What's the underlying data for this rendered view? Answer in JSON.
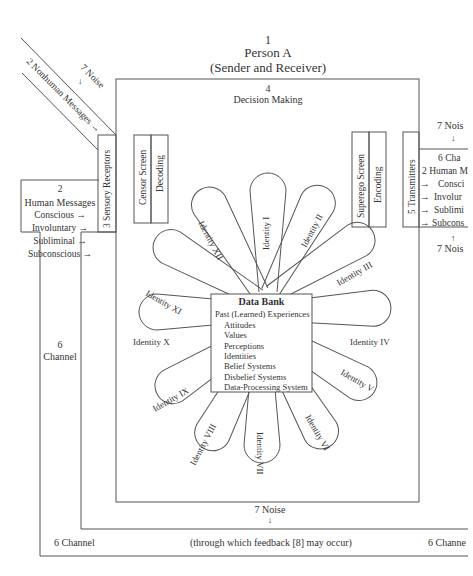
{
  "title": {
    "number": "1",
    "line1": "Person A",
    "line2": "(Sender and Receiver)"
  },
  "decision_making": {
    "number": "4",
    "label": "Decision Making"
  },
  "nonhuman_messages": {
    "noise": "7 Noise",
    "label": "2 Nonhuman Messages →"
  },
  "human_messages_in": {
    "number": "2",
    "label": "Human Messages",
    "items": [
      "Conscious →",
      "Involuntary →",
      "Subliminal →",
      "Subconscious →"
    ]
  },
  "sensory_receptors": "3  Sensory Receptors",
  "censor_screen": "Censor Screen",
  "decoding": "Decoding",
  "superego_screen": "Superego Screen",
  "encoding": "Encoding",
  "transmitters": "5  Transmitters",
  "human_messages_out": {
    "noise_top": "7 Nois",
    "channel": "6  Cha",
    "label": "2 Human M",
    "items": [
      "Consci",
      "Involur",
      "Sublimi",
      "Subcons"
    ],
    "noise_bottom": "7 Nois"
  },
  "data_bank": {
    "title": "Data Bank",
    "items": [
      "Past (Learned) Experiences",
      "Attitudes",
      "Values",
      "Perceptions",
      "Identities",
      "Belief Systems",
      "Disbelief Systems",
      "Data-Processing System"
    ]
  },
  "identities": [
    "Identity I",
    "Identity II",
    "Identity III",
    "Identity IV",
    "Identity V",
    "Identity VI",
    "Identity VII",
    "Identity VIII",
    "Identity IX",
    "Identity X",
    "Identity XI",
    "Identity XII"
  ],
  "channel_left": {
    "number": "6",
    "label": "Channel"
  },
  "bottom": {
    "noise": "7 Noise",
    "channel_left": "6 Channel",
    "feedback": "(through which feedback [8] may occur)",
    "channel_right": "6 Channe"
  }
}
